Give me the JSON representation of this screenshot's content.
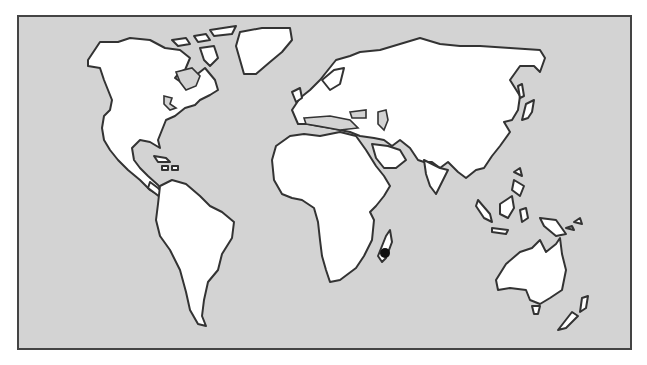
{
  "map": {
    "type": "world-outline",
    "colors": {
      "ocean": "#d3d3d3",
      "land": "#ffffff",
      "outline": "#333333",
      "marker": "#111111"
    },
    "marker": {
      "label": "Madagascar",
      "x": 385,
      "y": 253
    }
  }
}
